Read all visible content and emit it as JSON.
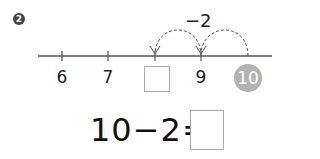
{
  "problem": {
    "number": "2",
    "number_line": {
      "labels": [
        "6",
        "7",
        "",
        "9",
        "10"
      ],
      "highlighted_label": "10",
      "jump_label": "−2",
      "highlight_color": "#b3b3b3"
    },
    "equation": "10−2="
  }
}
